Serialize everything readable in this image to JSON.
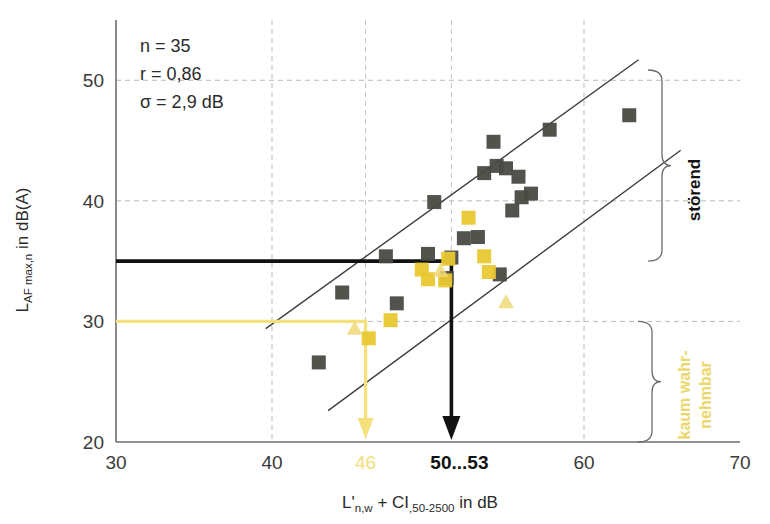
{
  "chart_data": {
    "type": "scatter",
    "title": "",
    "xlabel": "L'n,w + CI,50-2500 in dB",
    "ylabel": "LAF max,n in dB(A)",
    "xlim": [
      30,
      70
    ],
    "ylim": [
      20,
      55
    ],
    "xticks": [
      30,
      40,
      60,
      70
    ],
    "yticks": [
      20,
      30,
      40,
      50
    ],
    "grid": "dashed",
    "legend_position": "none",
    "annotations": {
      "n_label": "n = 35",
      "r_label": "r = 0,86",
      "sigma_label": "σ = 2,9 dB"
    },
    "axis_marks": {
      "x_yellow_label": "46",
      "x_yellow_value": 46,
      "x_black_label": "50...53",
      "x_black_value": 51.5
    },
    "threshold_lines": {
      "black_level": 35,
      "yellow_level": 30
    },
    "bracket_labels": {
      "upper": "störend",
      "lower_line1": "kaum wahr-",
      "lower_line2": "nehmbar"
    },
    "regression_bounds": [
      {
        "name": "upper-bound",
        "x1": 39.6,
        "y1": 29.4,
        "x2": 63.5,
        "y2": 51.7
      },
      {
        "name": "lower-bound",
        "x1": 43.6,
        "y1": 22.6,
        "x2": 66.2,
        "y2": 44.2
      }
    ],
    "series": [
      {
        "name": "dark-squares",
        "marker": "square",
        "color": "#4a4a44",
        "points": [
          [
            43.0,
            26.6
          ],
          [
            44.5,
            32.4
          ],
          [
            47.3,
            35.4
          ],
          [
            48.0,
            31.5
          ],
          [
            50.0,
            35.6
          ],
          [
            50.4,
            39.9
          ],
          [
            51.2,
            33.6
          ],
          [
            51.5,
            35.3
          ],
          [
            52.3,
            36.9
          ],
          [
            53.2,
            37.0
          ],
          [
            53.6,
            42.3
          ],
          [
            54.2,
            44.9
          ],
          [
            54.4,
            42.9
          ],
          [
            54.6,
            33.9
          ],
          [
            55.0,
            42.7
          ],
          [
            55.4,
            39.2
          ],
          [
            55.8,
            42.0
          ],
          [
            56.0,
            40.3
          ],
          [
            56.6,
            40.6
          ],
          [
            57.8,
            45.9
          ],
          [
            62.9,
            47.1
          ]
        ]
      },
      {
        "name": "yellow-squares",
        "marker": "square",
        "color": "#e8c832",
        "points": [
          [
            46.2,
            28.6
          ],
          [
            47.6,
            30.1
          ],
          [
            49.6,
            34.3
          ],
          [
            50.0,
            33.5
          ],
          [
            51.1,
            33.4
          ],
          [
            51.3,
            35.2
          ],
          [
            52.6,
            38.6
          ],
          [
            53.6,
            35.4
          ],
          [
            53.9,
            34.1
          ]
        ]
      },
      {
        "name": "yellow-triangles",
        "marker": "triangle",
        "color": "#f0d97a",
        "points": [
          [
            45.3,
            29.4
          ],
          [
            50.8,
            34.2
          ],
          [
            55.0,
            31.6
          ]
        ]
      }
    ]
  },
  "axis": {
    "y_title_main": "L",
    "y_title_sub": "AF max,n",
    "y_title_tail": " in dB(A)",
    "x_title_main": "L'",
    "x_title_sub1": "n,w",
    "x_title_plus": " + CI",
    "x_title_sub2": ",50-2500",
    "x_title_tail": " in dB"
  }
}
